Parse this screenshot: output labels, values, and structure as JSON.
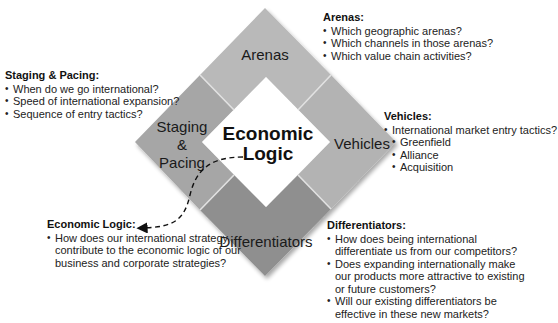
{
  "diagram": {
    "center": {
      "line1": "Economic",
      "line2": "Logic"
    },
    "segments": {
      "arenas": {
        "label": "Arenas",
        "color": "#b9b9b9"
      },
      "vehicles": {
        "label": "Vehicles",
        "color": "#b3b3b3"
      },
      "staging": {
        "line1": "Staging",
        "line2": "&",
        "line3": "Pacing",
        "color": "#a6a6a6"
      },
      "differentiators": {
        "label": "Differentiators",
        "color": "#8f8f8f"
      }
    }
  },
  "blocks": {
    "arenas": {
      "title": "Arenas:",
      "items": [
        "Which geographic arenas?",
        "Which channels in those arenas?",
        "Which value chain activities?"
      ]
    },
    "staging": {
      "title": "Staging & Pacing:",
      "items": [
        "When do we go international?",
        "Speed of international expansion?",
        "Sequence of entry tactics?"
      ]
    },
    "vehicles": {
      "title": "Vehicles:",
      "items": [
        "International market entry tactics?"
      ],
      "subitems": [
        "Greenfield",
        "Alliance",
        "Acquisition"
      ]
    },
    "logic": {
      "title": "Economic Logic:",
      "items": [
        "How does our international strategy contribute to the economic logic of our business and corporate strategies?"
      ]
    },
    "differentiators": {
      "title": "Differentiators:",
      "items": [
        "How does being international differentiate us from our competitors?",
        "Does expanding internationally make our products more attractive to existing or future customers?",
        "Will our existing differentiators be effective in these new markets?"
      ]
    }
  }
}
